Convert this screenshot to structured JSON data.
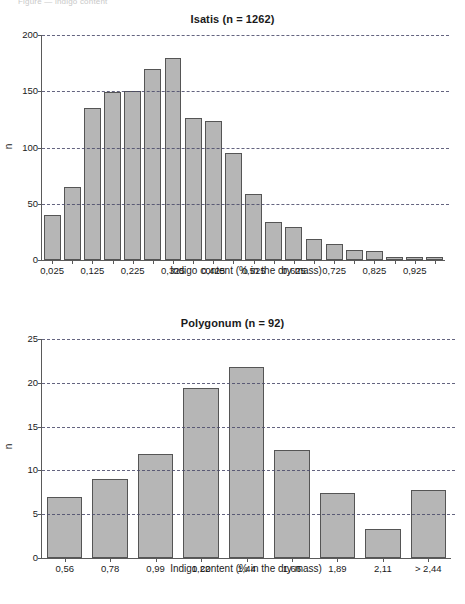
{
  "page": {
    "cut_header_text": "Figure — indigo content"
  },
  "colors": {
    "bar_fill": "#b6b6b6",
    "bar_stroke": "#555555",
    "axis": "#5a5a5a",
    "gridline": "#4a4a6a",
    "background": "#ffffff"
  },
  "chart_data": [
    {
      "id": "isatis",
      "type": "bar",
      "title": "Isatis (n = 1262)",
      "xlabel": "Indigo content (% in the dry mass)",
      "ylabel": "n",
      "ylim": [
        0,
        200
      ],
      "yticks": [
        0,
        50,
        100,
        150,
        200
      ],
      "ytick_labels": [
        "0",
        "50",
        "100",
        "150",
        "200"
      ],
      "grid": true,
      "legend": "none",
      "n": 1262,
      "categories": [
        "0,025",
        "0,075",
        "0,125",
        "0,175",
        "0,225",
        "0,275",
        "0,325",
        "0,375",
        "0,425",
        "0,475",
        "0,525",
        "0,575",
        "0,625",
        "0,675",
        "0,725",
        "0,775",
        "0,825",
        "0,875",
        "0,925",
        "0,975"
      ],
      "tick_labels": [
        "0,025",
        "",
        "0,125",
        "",
        "0,225",
        "",
        "0,325",
        "",
        "0,425",
        "",
        "0,525",
        "",
        "0,625",
        "",
        "0,725",
        "",
        "0,825",
        "",
        "0,925",
        ""
      ],
      "values": [
        40,
        65,
        135,
        149,
        150,
        170,
        180,
        126,
        124,
        95,
        59,
        34,
        29,
        19,
        14,
        9,
        8,
        3,
        3,
        3
      ]
    },
    {
      "id": "polygonum",
      "type": "bar",
      "title": "Polygonum (n = 92)",
      "xlabel": "Indigo content (% in the dry mass)",
      "ylabel": "n",
      "ylim": [
        0,
        25
      ],
      "yticks": [
        0,
        5,
        10,
        15,
        20,
        25
      ],
      "ytick_labels": [
        "0",
        "5",
        "10",
        "15",
        "20",
        "25"
      ],
      "grid": true,
      "legend": "none",
      "n": 92,
      "categories": [
        "0,56",
        "0,78",
        "0,99",
        "1,22",
        "1,44",
        "1,66",
        "1,89",
        "2,11",
        "> 2,44"
      ],
      "tick_labels": [
        "0,56",
        "0,78",
        "0,99",
        "1,22",
        "1,44",
        "1,66",
        "1,89",
        "2,11",
        "> 2,44"
      ],
      "values": [
        7.0,
        9.0,
        11.9,
        19.4,
        21.8,
        12.3,
        7.4,
        3.3,
        7.8
      ]
    }
  ]
}
